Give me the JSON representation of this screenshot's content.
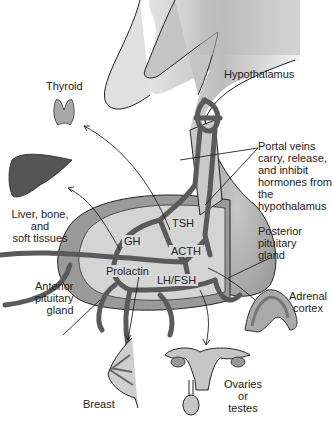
{
  "diagram": {
    "structures": {
      "hypothalamus": "Hypothalamus",
      "portal_veins": "Portal veins\ncarry, release,\nand inhibit\nhormones from\nthe hypothalamus",
      "posterior_pituitary": "Posterior\npituitary\ngland",
      "anterior_pituitary": "Anterior\npituitary\ngland"
    },
    "hormones": [
      "TSH",
      "GH",
      "ACTH",
      "Prolactin",
      "LH/FSH"
    ],
    "targets": {
      "thyroid": "Thyroid",
      "liver": "Liver, bone,\nand\nsoft tissues",
      "adrenal": "Adrenal\ncortex",
      "breast": "Breast",
      "gonads": "Ovaries\nor\ntestes"
    },
    "colors": {
      "dark_vessel": "#5a5a5a",
      "gland_fill": "#bdbdbd",
      "light_fill": "#d6d6d6",
      "outline": "#222222"
    }
  }
}
